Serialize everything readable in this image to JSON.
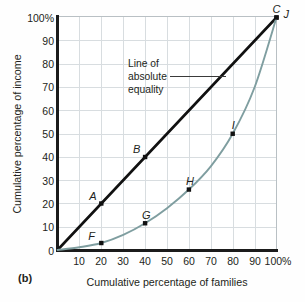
{
  "figure": {
    "panel_label": "(b)"
  },
  "chart_data": {
    "type": "line",
    "title": "",
    "xlabel": "Cumulative percentage of families",
    "ylabel": "Cumulative percentage of income",
    "xlim": [
      0,
      100
    ],
    "ylim": [
      0,
      100
    ],
    "grid": true,
    "legend_position": "none",
    "xticks": [
      "10",
      "20",
      "30",
      "40",
      "50",
      "60",
      "70",
      "80",
      "90",
      "100%"
    ],
    "xtick_values": [
      10,
      20,
      30,
      40,
      50,
      60,
      70,
      80,
      90,
      100
    ],
    "yticks": [
      "0",
      "10",
      "20",
      "30",
      "40",
      "50",
      "60",
      "70",
      "80",
      "90",
      "100%"
    ],
    "ytick_values": [
      0,
      10,
      20,
      30,
      40,
      50,
      60,
      70,
      80,
      90,
      100
    ],
    "series": [
      {
        "name": "Line of absolute equality",
        "color": "#111111",
        "x": [
          0,
          100
        ],
        "y": [
          0,
          100
        ],
        "points": [
          {
            "label": "A",
            "x": 20,
            "y": 20
          },
          {
            "label": "B",
            "x": 40,
            "y": 40
          },
          {
            "label": "C",
            "x": 100,
            "y": 100
          }
        ]
      },
      {
        "name": "Lorenz curve",
        "color": "#7f9ea0",
        "x": [
          0,
          10,
          20,
          30,
          40,
          50,
          60,
          70,
          80,
          90,
          100
        ],
        "y": [
          0,
          1.2,
          3,
          6.5,
          11.5,
          18,
          26,
          36,
          50,
          70,
          100
        ],
        "points": [
          {
            "label": "F",
            "x": 20,
            "y": 3
          },
          {
            "label": "G",
            "x": 40,
            "y": 11.5
          },
          {
            "label": "H",
            "x": 60,
            "y": 26
          },
          {
            "label": "I",
            "x": 80,
            "y": 50
          },
          {
            "label": "J",
            "x": 100,
            "y": 100
          }
        ]
      }
    ],
    "annotations": [
      {
        "name": "line-of-absolute-equality",
        "lines": [
          "Line of",
          "absolute",
          "equality"
        ],
        "leader": true
      }
    ]
  }
}
